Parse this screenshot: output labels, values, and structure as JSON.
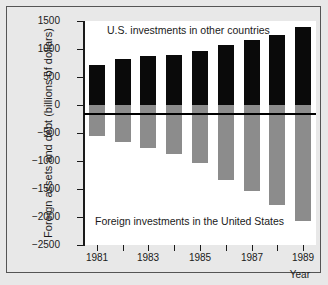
{
  "chart_data": {
    "type": "bar",
    "title": "",
    "subtitle": "",
    "xlabel": "Year",
    "ylabel": "Foreign assets and debt (billions of dollars)",
    "ylim": [
      -2500,
      1500
    ],
    "ytick_values": [
      1500,
      1000,
      500,
      0,
      -500,
      -1000,
      -1500,
      -2000,
      -2500
    ],
    "ytick_labels": [
      "1500",
      "1000",
      "500",
      "0",
      "−500",
      "−1000",
      "−1500",
      "−2000",
      "−2500"
    ],
    "grid": false,
    "legend_position": "in-plot annotations",
    "categories": [
      1981,
      1982,
      1983,
      1984,
      1985,
      1986,
      1987,
      1988,
      1989
    ],
    "xtick_values": [
      1981,
      1982,
      1983,
      1984,
      1985,
      1986,
      1987,
      1988,
      1989
    ],
    "xtick_labels": [
      "1981",
      "",
      "1983",
      "",
      "1985",
      "",
      "1987",
      "",
      "1989"
    ],
    "xtick_labeled": [
      {
        "year": 1981,
        "label": "1981"
      },
      {
        "year": 1983,
        "label": "1983"
      },
      {
        "year": 1985,
        "label": "1985"
      },
      {
        "year": 1987,
        "label": "1987"
      },
      {
        "year": 1989,
        "label": "1989"
      }
    ],
    "series": [
      {
        "name": "U.S. investments in other countries",
        "color": "#0a0a0a",
        "values": [
          720,
          830,
          880,
          900,
          960,
          1080,
          1160,
          1250,
          1390
        ]
      },
      {
        "name": "Foreign investments in the United States",
        "color": "#8c8c8c",
        "values": [
          -560,
          -660,
          -770,
          -880,
          -1040,
          -1340,
          -1540,
          -1780,
          -2080
        ]
      }
    ],
    "annotations": [
      {
        "name": "top-annotation",
        "text": "U.S. investments in other countries"
      },
      {
        "name": "bottom-annotation",
        "text": "Foreign investments in the United States"
      }
    ]
  },
  "axis": {
    "y_title": "Foreign assets and debt (billions of dollars)",
    "x_title": "Year"
  }
}
